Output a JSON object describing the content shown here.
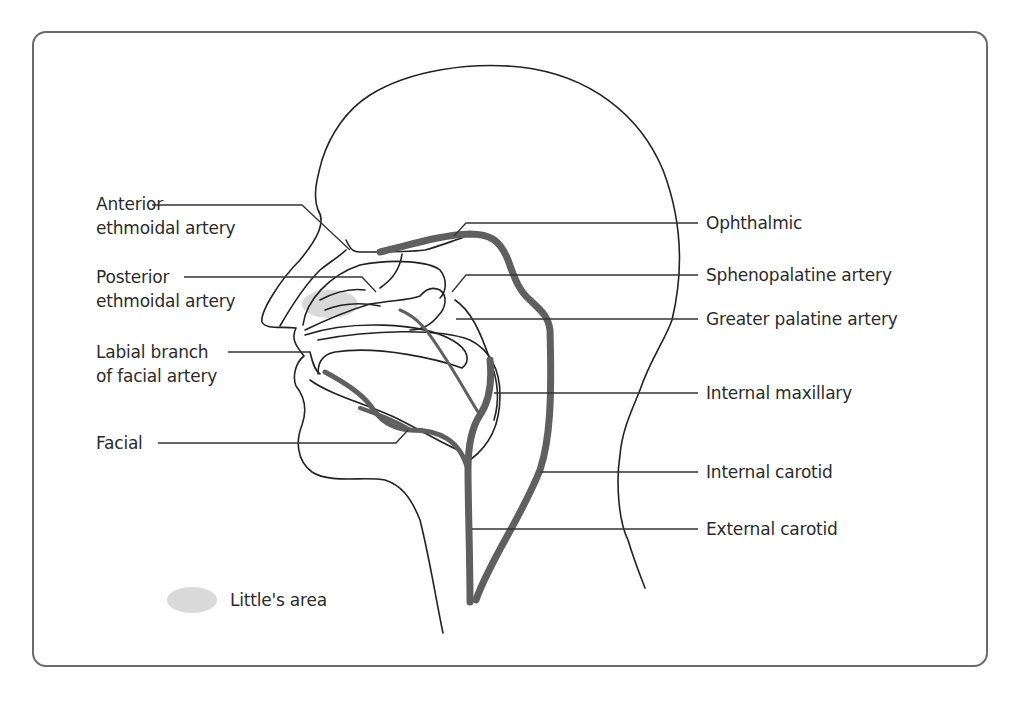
{
  "diagram": {
    "left_labels": [
      {
        "id": "anterior-ethmoidal",
        "line1": "Anterior",
        "line2": "ethmoidal artery"
      },
      {
        "id": "posterior-ethmoidal",
        "line1": "Posterior",
        "line2": "ethmoidal artery"
      },
      {
        "id": "labial-branch",
        "line1": "Labial branch",
        "line2": "of facial artery"
      },
      {
        "id": "facial",
        "line1": "Facial",
        "line2": ""
      }
    ],
    "right_labels": [
      {
        "id": "ophthalmic",
        "text": "Ophthalmic"
      },
      {
        "id": "sphenopalatine",
        "text": "Sphenopalatine artery"
      },
      {
        "id": "greater-palatine",
        "text": "Greater palatine artery"
      },
      {
        "id": "internal-maxillary",
        "text": "Internal maxillary"
      },
      {
        "id": "internal-carotid",
        "text": "Internal carotid"
      },
      {
        "id": "external-carotid",
        "text": "External carotid"
      }
    ],
    "legend": {
      "swatch": "grey-ellipse",
      "label": "Little's area"
    },
    "colors": {
      "outline": "#222222",
      "artery": "#5f5f5f",
      "littles_area": "#d9d9d9",
      "frame": "#6a6a6a"
    }
  }
}
